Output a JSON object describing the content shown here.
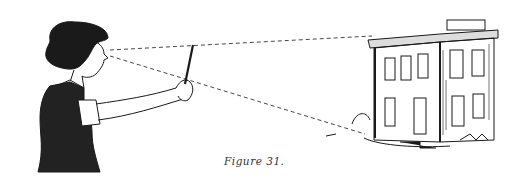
{
  "figure": {
    "caption": "Figure 31.",
    "colors": {
      "ink": "#1a1a1a",
      "paper": "#ffffff",
      "caption": "#333333"
    }
  }
}
